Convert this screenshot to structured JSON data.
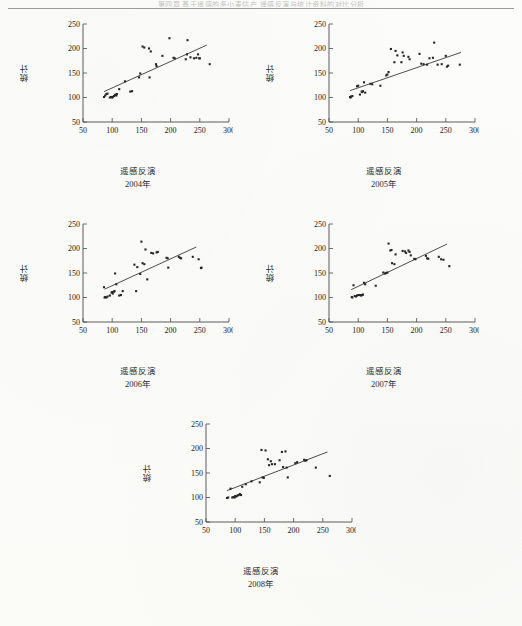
{
  "page": {
    "running_head": "第四章  基于遥感的冬小麦估产   遥感反演与统计资料的对比分析",
    "footer": ""
  },
  "axes": {
    "ylabel": "统计",
    "xlabel": "遥感反演",
    "x_ticks": [
      50,
      100,
      150,
      200,
      250,
      300
    ],
    "y_ticks": [
      50,
      100,
      150,
      200,
      250
    ],
    "xlim": [
      50,
      300
    ],
    "ylim": [
      50,
      250
    ],
    "grid": false
  },
  "chart_data": [
    {
      "type": "scatter",
      "title": "2004年",
      "xlabel": "遥感反演",
      "ylabel": "统计",
      "xlim": [
        50,
        300
      ],
      "ylim": [
        50,
        250
      ],
      "x": [
        86,
        88,
        90,
        92,
        96,
        98,
        100,
        101,
        103,
        105,
        106,
        107,
        108,
        112,
        122,
        131,
        134,
        146,
        148,
        152,
        155,
        163,
        164,
        166,
        175,
        176,
        186,
        198,
        205,
        207,
        226,
        228,
        229,
        234,
        240,
        244,
        247,
        249,
        250,
        267
      ],
      "y": [
        101,
        104,
        107,
        108,
        100,
        101,
        100,
        101,
        103,
        105,
        106,
        104,
        107,
        117,
        133,
        112,
        113,
        141,
        149,
        204,
        202,
        200,
        141,
        194,
        168,
        164,
        185,
        221,
        181,
        180,
        178,
        188,
        217,
        182,
        180,
        181,
        188,
        180,
        180,
        168
      ],
      "trend_line": {
        "x": [
          86,
          262
        ],
        "y": [
          112,
          207
        ]
      }
    },
    {
      "type": "scatter",
      "title": "2005年",
      "xlabel": "遥感反演",
      "ylabel": "统计",
      "xlim": [
        50,
        300
      ],
      "ylim": [
        50,
        250
      ],
      "x": [
        86,
        87,
        88,
        90,
        98,
        100,
        103,
        106,
        107,
        108,
        110,
        112,
        121,
        124,
        138,
        148,
        150,
        152,
        156,
        162,
        164,
        167,
        174,
        176,
        178,
        186,
        188,
        205,
        208,
        212,
        218,
        222,
        228,
        230,
        236,
        243,
        250,
        252,
        254,
        274
      ],
      "y": [
        101,
        100,
        102,
        103,
        123,
        124,
        106,
        112,
        111,
        113,
        131,
        110,
        128,
        127,
        124,
        145,
        147,
        152,
        199,
        172,
        195,
        186,
        172,
        192,
        185,
        183,
        178,
        189,
        169,
        168,
        167,
        180,
        181,
        212,
        167,
        168,
        185,
        163,
        165,
        167
      ],
      "trend_line": {
        "x": [
          86,
          276
        ],
        "y": [
          114,
          192
        ]
      }
    },
    {
      "type": "scatter",
      "title": "2006年",
      "xlabel": "遥感反演",
      "ylabel": "统计",
      "xlim": [
        50,
        300
      ],
      "ylim": [
        50,
        250
      ],
      "x": [
        86,
        87,
        88,
        90,
        92,
        96,
        99,
        100,
        101,
        103,
        104,
        105,
        107,
        112,
        115,
        118,
        138,
        141,
        143,
        148,
        150,
        152,
        155,
        157,
        160,
        167,
        170,
        176,
        178,
        193,
        195,
        196,
        214,
        216,
        218,
        238,
        248,
        252,
        253
      ],
      "y": [
        121,
        100,
        101,
        100,
        102,
        104,
        110,
        111,
        108,
        112,
        113,
        149,
        127,
        104,
        105,
        113,
        167,
        113,
        162,
        148,
        214,
        170,
        168,
        198,
        137,
        191,
        190,
        192,
        193,
        181,
        180,
        161,
        183,
        181,
        180,
        183,
        178,
        160,
        161
      ],
      "trend_line": {
        "x": [
          87,
          244
        ],
        "y": [
          117,
          203
        ]
      }
    },
    {
      "type": "scatter",
      "title": "2007年",
      "xlabel": "遥感反演",
      "ylabel": "统计",
      "xlim": [
        50,
        300
      ],
      "ylim": [
        50,
        250
      ],
      "x": [
        89,
        90,
        92,
        94,
        96,
        98,
        100,
        103,
        105,
        107,
        108,
        110,
        112,
        130,
        143,
        146,
        148,
        150,
        152,
        155,
        157,
        158,
        162,
        164,
        176,
        180,
        182,
        186,
        188,
        190,
        196,
        198,
        216,
        218,
        220,
        238,
        242,
        246,
        256
      ],
      "y": [
        101,
        100,
        125,
        103,
        102,
        104,
        105,
        105,
        104,
        105,
        106,
        130,
        127,
        124,
        151,
        149,
        150,
        151,
        210,
        196,
        197,
        170,
        168,
        188,
        195,
        194,
        191,
        196,
        193,
        186,
        179,
        178,
        185,
        180,
        179,
        183,
        178,
        177,
        164
      ],
      "trend_line": {
        "x": [
          88,
          252
        ],
        "y": [
          116,
          209
        ]
      }
    },
    {
      "type": "scatter",
      "title": "2008年",
      "xlabel": "遥感反演",
      "ylabel": "统计",
      "xlim": [
        50,
        300
      ],
      "ylim": [
        50,
        250
      ],
      "x": [
        86,
        88,
        92,
        95,
        97,
        99,
        100,
        102,
        104,
        106,
        108,
        110,
        112,
        118,
        128,
        142,
        145,
        147,
        149,
        152,
        156,
        158,
        161,
        163,
        168,
        176,
        180,
        182,
        186,
        188,
        190,
        203,
        206,
        218,
        220,
        222,
        238,
        262
      ],
      "y": [
        99,
        100,
        118,
        100,
        101,
        100,
        103,
        102,
        104,
        105,
        107,
        105,
        122,
        127,
        133,
        131,
        197,
        141,
        140,
        196,
        178,
        166,
        174,
        168,
        168,
        176,
        193,
        162,
        194,
        161,
        141,
        170,
        172,
        177,
        175,
        176,
        161,
        144
      ],
      "trend_line": {
        "x": [
          86,
          258
        ],
        "y": [
          114,
          193
        ]
      }
    }
  ]
}
